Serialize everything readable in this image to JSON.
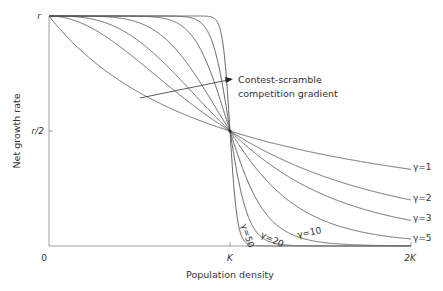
{
  "chart_data": {
    "type": "line",
    "title": "",
    "xlabel": "Population density",
    "ylabel": "Net growth rate",
    "xlim": [
      0,
      2
    ],
    "ylim": [
      0,
      1
    ],
    "x_ticks": [
      {
        "value": 0,
        "label": "0"
      },
      {
        "value": 1,
        "label": "K"
      },
      {
        "value": 2,
        "label": "2K"
      }
    ],
    "y_ticks": [
      {
        "value": 0.5,
        "label": "r/2"
      },
      {
        "value": 1,
        "label": "r"
      }
    ],
    "model": "rate = r / (1 + (N/K)^gamma)",
    "series": [
      {
        "name": "γ=1",
        "gamma": 1
      },
      {
        "name": "γ=2",
        "gamma": 2
      },
      {
        "name": "γ=3",
        "gamma": 3
      },
      {
        "name": "γ=5",
        "gamma": 5
      },
      {
        "name": "γ=10",
        "gamma": 10
      },
      {
        "name": "γ=20",
        "gamma": 20
      },
      {
        "name": "γ=50",
        "gamma": 50
      }
    ],
    "annotation": {
      "lines": [
        "Contest-scramble",
        "competition gradient"
      ]
    },
    "grid": false,
    "legend": "inline labels at right end of curves"
  }
}
